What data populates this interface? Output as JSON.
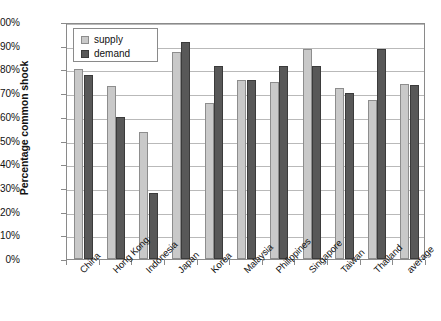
{
  "chart_data": {
    "type": "bar",
    "title": "",
    "xlabel": "",
    "ylabel": "Percentage common shock",
    "ylim": [
      0,
      100
    ],
    "grid": true,
    "legend_position": "top-left",
    "categories": [
      "China",
      "Hong Kong",
      "Indonesia",
      "Japan",
      "Korea",
      "Malaysia",
      "Philippines",
      "Singapore",
      "Taiwan",
      "Thailand",
      "average"
    ],
    "ytick_labels": [
      "0%",
      "10%",
      "20%",
      "30%",
      "40%",
      "50%",
      "60%",
      "70%",
      "80%",
      "90%",
      "100%"
    ],
    "ytick_values": [
      0,
      10,
      20,
      30,
      40,
      50,
      60,
      70,
      80,
      90,
      100
    ],
    "series": [
      {
        "name": "supply",
        "color": "#c9c9c9",
        "values": [
          80,
          73,
          53.5,
          87.5,
          66,
          75.5,
          74.5,
          88.5,
          72,
          67,
          74
        ]
      },
      {
        "name": "demand",
        "color": "#585858",
        "values": [
          77.5,
          60,
          28,
          91.5,
          81.5,
          75.5,
          81.5,
          81.5,
          70,
          88.5,
          73.5
        ]
      }
    ]
  }
}
